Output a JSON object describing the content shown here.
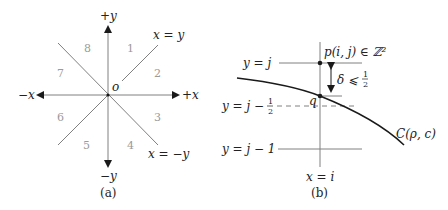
{
  "panel_a": {
    "caption": "(a)",
    "axis_labels": {
      "pos_y": "+y",
      "neg_y": "−y",
      "pos_x": "+x",
      "neg_x": "−x",
      "origin": "o"
    },
    "diagonal_labels": {
      "x_eq_y": "x = y",
      "x_eq_neg_y": "x = −y"
    },
    "octants": [
      "1",
      "2",
      "3",
      "4",
      "5",
      "6",
      "7",
      "8"
    ]
  },
  "panel_b": {
    "caption": "(b)",
    "line_labels": {
      "y_eq_j": "y = j",
      "y_eq_j_minus_half_prefix": "y = j −",
      "y_eq_j_minus_1": "y = j − 1",
      "x_eq_i": "x = i"
    },
    "point_p": "p(i, j) ∈ ℤ²",
    "point_q": "q",
    "delta_label_prefix": "δ ⩽",
    "half_num": "1",
    "half_den": "2",
    "curve_label": "C(ρ, c)"
  },
  "colors": {
    "axis": "#808080",
    "curve": "#1a1a1a",
    "text": "#222222",
    "octant_text": "#9a9a9a"
  }
}
